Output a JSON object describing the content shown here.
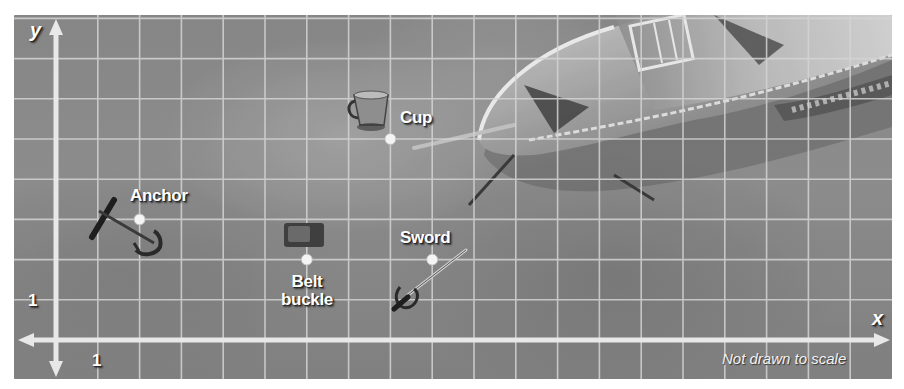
{
  "figure": {
    "axis_x_label": "x",
    "axis_y_label": "y",
    "tick_x": "1",
    "tick_y": "1",
    "note": "Not drawn to scale",
    "grid": {
      "origin_px": [
        42,
        325
      ],
      "unit_x_px": 41.8,
      "unit_y_px": 40.2
    },
    "colors": {
      "grid": "#d8d8d8",
      "axis": "#e6e6e6",
      "dot": "#f4f4f4",
      "water": "#878787"
    }
  },
  "points": [
    {
      "name": "Anchor",
      "label": "Anchor",
      "x": 2,
      "y": 3
    },
    {
      "name": "Belt buckle",
      "label_line1": "Belt",
      "label_line2": "buckle",
      "x": 6,
      "y": 2
    },
    {
      "name": "Sword",
      "label": "Sword",
      "x": 9,
      "y": 2
    },
    {
      "name": "Cup",
      "label": "Cup",
      "x": 8,
      "y": 5
    }
  ],
  "objects": [
    "anchor",
    "belt-buckle",
    "sword",
    "cup",
    "shipwreck"
  ]
}
